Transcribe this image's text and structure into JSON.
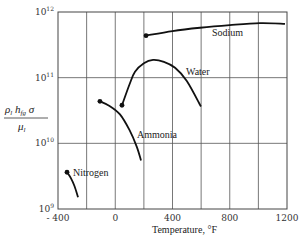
{
  "chart_data": {
    "type": "line",
    "title": "",
    "xlabel": "Temperature, °F",
    "ylabel": "ρ_l h_fg σ / μ_l",
    "xlim": [
      -400,
      1200
    ],
    "ylim_log10": [
      9,
      12
    ],
    "yscale": "log",
    "grid": true,
    "x_ticks": [
      -400,
      -200,
      0,
      200,
      400,
      600,
      800,
      1000,
      1200
    ],
    "x_tick_labels": [
      "- 400",
      "0",
      "400",
      "800",
      "1200"
    ],
    "x_tick_label_values": [
      -400,
      0,
      400,
      800,
      1200
    ],
    "y_tick_labels": [
      {
        "base": "10",
        "exp": "9",
        "value": 1000000000.0
      },
      {
        "base": "10",
        "exp": "10",
        "value": 10000000000.0
      },
      {
        "base": "10",
        "exp": "11",
        "value": 100000000000.0
      },
      {
        "base": "10",
        "exp": "12",
        "value": 1000000000000.0
      }
    ],
    "series": [
      {
        "name": "Sodium",
        "start_marker": true,
        "x": [
          215,
          400,
          592,
          800,
          1011,
          1186
        ],
        "log10_y": [
          11.64,
          11.71,
          11.76,
          11.8,
          11.83,
          11.82
        ]
      },
      {
        "name": "Water",
        "start_marker": true,
        "x": [
          47,
          100,
          138,
          200,
          264,
          340,
          418,
          500,
          599
        ],
        "log10_y": [
          10.58,
          10.9,
          11.09,
          11.22,
          11.27,
          11.24,
          11.15,
          10.95,
          10.56
        ]
      },
      {
        "name": "Ammonia",
        "start_marker": true,
        "x": [
          -107,
          -40,
          33,
          100,
          150,
          180
        ],
        "log10_y": [
          10.64,
          10.57,
          10.44,
          10.2,
          9.95,
          9.74
        ]
      },
      {
        "name": "Nitrogen",
        "start_marker": true,
        "x": [
          -337,
          -310,
          -285,
          -260
        ],
        "log10_y": [
          9.56,
          9.47,
          9.35,
          9.18
        ]
      }
    ],
    "annotations": [
      {
        "text": "Sodium",
        "near": "sodium-curve"
      },
      {
        "text": "Water",
        "near": "water-curve"
      },
      {
        "text": "Ammonia",
        "near": "ammonia-curve"
      },
      {
        "text": "Nitrogen",
        "near": "nitrogen-curve"
      }
    ]
  },
  "labels": {
    "sodium": "Sodium",
    "water": "Water",
    "ammonia": "Ammonia",
    "nitrogen": "Nitrogen",
    "xaxis": "Temperature, °F",
    "ylabel_num": "ρ",
    "ylabel_den": "μ"
  }
}
